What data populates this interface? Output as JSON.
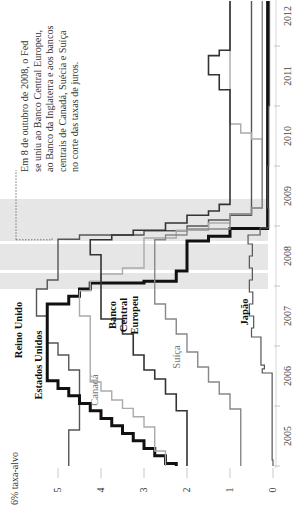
{
  "chart_data": {
    "type": "line",
    "subtype": "step",
    "orientation": "rotated-90-ccw",
    "title": "",
    "ylabel": "6% taxa-alvo",
    "xlabel": "",
    "ylim": [
      0,
      6
    ],
    "y_ticks": [
      0,
      1,
      2,
      3,
      4,
      5
    ],
    "xlim": [
      2005,
      2012.75
    ],
    "x_tick_labels": [
      "2005",
      "2006",
      "2007",
      "2008",
      "2009",
      "2010",
      "2011",
      "2012"
    ],
    "recession_shading": [
      [
        2007.95,
        2009.45
      ]
    ],
    "annotation": {
      "lines": [
        "Em 8 de outubro de 2008, o Fed",
        "se uniu ao Banco Central Europeu,",
        "ao Banco da Inglaterra e aos bancos",
        "centrais de Canadá, Suécia e Suíça",
        "no corte das taxas de juros."
      ],
      "date": 2008.77
    },
    "series": [
      {
        "name": "Reino Unido",
        "label_lines": [
          "Reino Unido"
        ],
        "color": "#555555",
        "width": 1.4,
        "bold": true,
        "label_pos": [
          22,
          330
        ],
        "points": [
          [
            2005.0,
            4.75
          ],
          [
            2005.6,
            4.5
          ],
          [
            2006.6,
            4.75
          ],
          [
            2006.85,
            5.0
          ],
          [
            2007.05,
            5.25
          ],
          [
            2007.5,
            5.5
          ],
          [
            2007.95,
            5.25
          ],
          [
            2008.1,
            5.0
          ],
          [
            2008.78,
            4.5
          ],
          [
            2008.85,
            3.0
          ],
          [
            2008.92,
            2.0
          ],
          [
            2009.0,
            1.5
          ],
          [
            2009.1,
            1.0
          ],
          [
            2009.18,
            0.5
          ],
          [
            2012.75,
            0.5
          ]
        ]
      },
      {
        "name": "Estados Unidos",
        "label_lines": [
          "Estados Unidos"
        ],
        "color": "#111111",
        "width": 3.0,
        "bold": true,
        "label_pos": [
          42,
          365
        ],
        "points": [
          [
            2005.0,
            2.25
          ],
          [
            2005.04,
            2.5
          ],
          [
            2005.17,
            2.75
          ],
          [
            2005.29,
            3.0
          ],
          [
            2005.42,
            3.25
          ],
          [
            2005.54,
            3.5
          ],
          [
            2005.67,
            3.75
          ],
          [
            2005.79,
            4.0
          ],
          [
            2005.92,
            4.25
          ],
          [
            2006.04,
            4.5
          ],
          [
            2006.17,
            4.75
          ],
          [
            2006.29,
            5.0
          ],
          [
            2006.42,
            5.25
          ],
          [
            2007.7,
            4.75
          ],
          [
            2007.83,
            4.5
          ],
          [
            2007.95,
            4.25
          ],
          [
            2008.05,
            3.0
          ],
          [
            2008.08,
            2.25
          ],
          [
            2008.25,
            2.0
          ],
          [
            2008.75,
            1.5
          ],
          [
            2008.83,
            1.0
          ],
          [
            2008.96,
            0.125
          ],
          [
            2012.75,
            0.125
          ]
        ]
      },
      {
        "name": "Canadá",
        "label_lines": [
          "Canadá"
        ],
        "color": "#aaaaaa",
        "width": 1.4,
        "bold": false,
        "label_pos": [
          98,
          390
        ],
        "points": [
          [
            2005.0,
            2.5
          ],
          [
            2005.25,
            2.75
          ],
          [
            2005.65,
            3.0
          ],
          [
            2005.82,
            3.25
          ],
          [
            2005.96,
            3.5
          ],
          [
            2006.1,
            3.75
          ],
          [
            2006.25,
            4.0
          ],
          [
            2006.4,
            4.25
          ],
          [
            2007.5,
            4.5
          ],
          [
            2007.92,
            4.25
          ],
          [
            2008.08,
            4.0
          ],
          [
            2008.2,
            3.5
          ],
          [
            2008.3,
            3.0
          ],
          [
            2008.8,
            2.25
          ],
          [
            2008.93,
            1.5
          ],
          [
            2009.05,
            1.0
          ],
          [
            2009.2,
            0.5
          ],
          [
            2009.3,
            0.25
          ],
          [
            2010.45,
            0.5
          ],
          [
            2010.55,
            0.75
          ],
          [
            2010.7,
            1.0
          ],
          [
            2012.75,
            1.0
          ]
        ]
      },
      {
        "name": "Banco Central Europeu",
        "label_lines": [
          "Banco",
          "Central",
          "Europeu"
        ],
        "color": "#333333",
        "width": 1.6,
        "bold": true,
        "label_pos": [
          116,
          315
        ],
        "points": [
          [
            2005.0,
            2.0
          ],
          [
            2005.92,
            2.25
          ],
          [
            2006.2,
            2.5
          ],
          [
            2006.45,
            2.75
          ],
          [
            2006.6,
            3.0
          ],
          [
            2006.85,
            3.25
          ],
          [
            2007.2,
            3.5
          ],
          [
            2007.45,
            4.0
          ],
          [
            2008.52,
            4.25
          ],
          [
            2008.77,
            3.75
          ],
          [
            2008.85,
            3.25
          ],
          [
            2008.93,
            2.5
          ],
          [
            2009.05,
            2.0
          ],
          [
            2009.18,
            1.5
          ],
          [
            2009.25,
            1.25
          ],
          [
            2009.36,
            1.0
          ],
          [
            2011.27,
            1.25
          ],
          [
            2011.52,
            1.5
          ],
          [
            2011.84,
            1.25
          ],
          [
            2011.93,
            1.0
          ],
          [
            2012.75,
            1.0
          ]
        ]
      },
      {
        "name": "Suíça",
        "label_lines": [
          "Suíça"
        ],
        "color": "#888888",
        "width": 1.4,
        "bold": false,
        "label_pos": [
          180,
          357
        ],
        "points": [
          [
            2005.0,
            0.75
          ],
          [
            2005.95,
            1.0
          ],
          [
            2006.2,
            1.25
          ],
          [
            2006.4,
            1.5
          ],
          [
            2006.65,
            1.75
          ],
          [
            2006.9,
            2.0
          ],
          [
            2007.2,
            2.25
          ],
          [
            2007.45,
            2.5
          ],
          [
            2007.7,
            2.75
          ],
          [
            2008.77,
            2.5
          ],
          [
            2008.85,
            2.0
          ],
          [
            2008.95,
            1.0
          ],
          [
            2009.2,
            0.5
          ],
          [
            2009.3,
            0.25
          ],
          [
            2012.75,
            0.25
          ]
        ]
      },
      {
        "name": "Japão",
        "label_lines": [
          "Japão"
        ],
        "color": "#555555",
        "width": 1.2,
        "bold": true,
        "label_pos": [
          248,
          312
        ],
        "points": [
          [
            2005.0,
            0.0
          ],
          [
            2005.1,
            0.02
          ],
          [
            2006.5,
            0.02
          ],
          [
            2006.55,
            0.25
          ],
          [
            2006.62,
            0.2
          ],
          [
            2006.68,
            0.28
          ],
          [
            2007.15,
            0.5
          ],
          [
            2007.3,
            0.45
          ],
          [
            2007.5,
            0.55
          ],
          [
            2007.7,
            0.47
          ],
          [
            2007.9,
            0.55
          ],
          [
            2008.1,
            0.48
          ],
          [
            2008.3,
            0.55
          ],
          [
            2008.5,
            0.48
          ],
          [
            2008.7,
            0.58
          ],
          [
            2008.85,
            0.3
          ],
          [
            2008.97,
            0.1
          ],
          [
            2009.3,
            0.12
          ],
          [
            2010.0,
            0.1
          ],
          [
            2011.0,
            0.08
          ],
          [
            2012.75,
            0.08
          ]
        ]
      }
    ]
  }
}
